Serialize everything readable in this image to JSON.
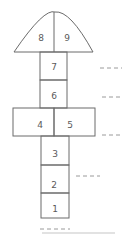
{
  "diagram": {
    "type": "hopscotch",
    "squares": [
      {
        "label": "1",
        "x": 41,
        "y": 193,
        "w": 28,
        "h": 25
      },
      {
        "label": "2",
        "x": 41,
        "y": 165,
        "w": 28,
        "h": 28
      },
      {
        "label": "3",
        "x": 41,
        "y": 136,
        "w": 28,
        "h": 29
      },
      {
        "label": "4",
        "x": 13,
        "y": 108,
        "w": 41,
        "h": 28
      },
      {
        "label": "5",
        "x": 54,
        "y": 108,
        "w": 41,
        "h": 28
      },
      {
        "label": "6",
        "x": 40,
        "y": 80,
        "w": 27,
        "h": 28
      },
      {
        "label": "7",
        "x": 40,
        "y": 52,
        "w": 27,
        "h": 28
      }
    ],
    "dome": {
      "left_label": "8",
      "right_label": "9"
    },
    "blanks": [
      {
        "x1": 100,
        "y": 68,
        "x2": 122
      },
      {
        "x1": 102,
        "y": 97,
        "x2": 122
      },
      {
        "x1": 102,
        "y": 135,
        "x2": 123
      },
      {
        "x1": 76,
        "y": 176,
        "x2": 100
      },
      {
        "x1": 40,
        "y": 230,
        "x2": 70
      }
    ],
    "line_color": "#6b6b6b",
    "label_color": "#5a5a5a"
  }
}
